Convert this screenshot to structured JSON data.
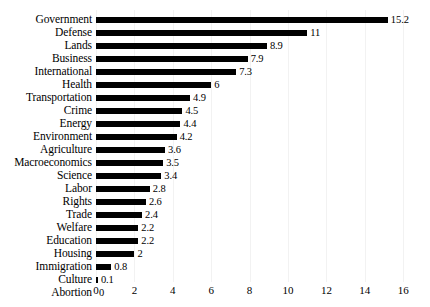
{
  "chart_data": {
    "type": "bar",
    "orientation": "horizontal",
    "title": "",
    "subtitle": "",
    "xlabel": "",
    "ylabel": "",
    "xlim": [
      0,
      16
    ],
    "xticks": [
      0,
      2,
      4,
      6,
      8,
      10,
      12,
      14,
      16
    ],
    "xtick_labels": [
      "0",
      "2",
      "4",
      "6",
      "8",
      "10",
      "12",
      "14",
      "16"
    ],
    "grid": false,
    "legend": false,
    "bar_color": "#000000",
    "background_color": "#ffffff",
    "sorted": "descending",
    "categories": [
      "Government",
      "Defense",
      "Lands",
      "Business",
      "International",
      "Health",
      "Transportation",
      "Crime",
      "Energy",
      "Environment",
      "Agriculture",
      "Macroeconomics",
      "Science",
      "Labor",
      "Rights",
      "Trade",
      "Welfare",
      "Education",
      "Housing",
      "Immigration",
      "Culture",
      "Abortion"
    ],
    "values": [
      15.2,
      11,
      8.9,
      7.9,
      7.3,
      6,
      4.9,
      4.5,
      4.4,
      4.2,
      3.6,
      3.5,
      3.4,
      2.8,
      2.6,
      2.4,
      2.2,
      2.2,
      2,
      0.8,
      0.1,
      0
    ],
    "value_labels": [
      "15.2",
      "11",
      "8.9",
      "7.9",
      "7.3",
      "6",
      "4.9",
      "4.5",
      "4.4",
      "4.2",
      "3.6",
      "3.5",
      "3.4",
      "2.8",
      "2.6",
      "2.4",
      "2.2",
      "2.2",
      "2",
      "0.8",
      "0.1",
      "0"
    ]
  }
}
